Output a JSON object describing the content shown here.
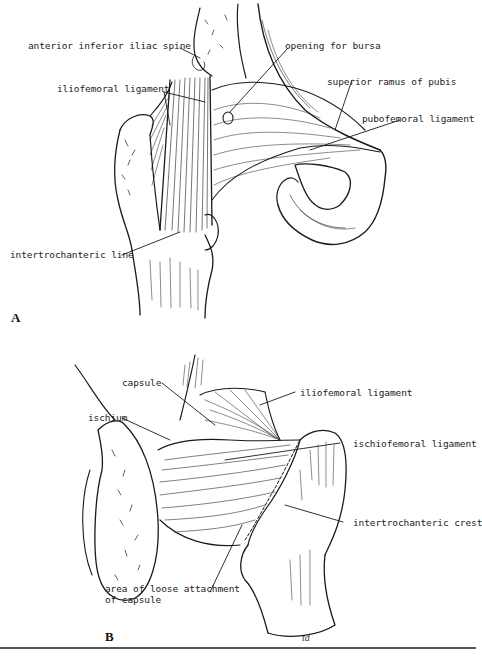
{
  "figure": {
    "panels": [
      {
        "id": "A",
        "letter": "A",
        "view": "anterior view of hip joint",
        "labels": {
          "anterior_inferior_iliac_spine": "anterior inferior iliac spine",
          "iliofemoral_ligament": "iliofemoral ligament",
          "opening_for_bursa": "opening for bursa",
          "superior_ramus_of_pubis": "superior ramus of pubis",
          "pubofemoral_ligament": "pubofemoral ligament",
          "intertrochanteric_line": "intertrochanteric line"
        }
      },
      {
        "id": "B",
        "letter": "B",
        "view": "posterior view of hip joint",
        "labels": {
          "capsule": "capsule",
          "ischium": "ischium",
          "iliofemoral_ligament": "iliofemoral ligament",
          "ischiofemoral_ligament": "ischiofemoral ligament",
          "intertrochanteric_crest": "intertrochanteric crest",
          "area_loose_line1": "area of loose attachment",
          "area_loose_line2": "of capsule"
        }
      }
    ],
    "artist_signature": "td",
    "colors": {
      "line": "#1a1a1a",
      "background": "#ffffff",
      "rule": "#555555"
    }
  }
}
